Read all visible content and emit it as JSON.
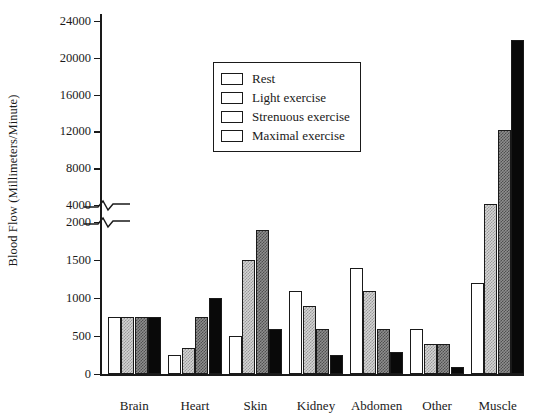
{
  "chart_data": {
    "type": "bar",
    "title": "",
    "xlabel": "",
    "ylabel": "Blood Flow (Millimeters/Minute)",
    "categories": [
      "Brain",
      "Heart",
      "Skin",
      "Kidney",
      "Abdomen",
      "Other",
      "Muscle"
    ],
    "series": [
      {
        "name": "Rest",
        "fill": "white",
        "values": [
          750,
          250,
          500,
          1100,
          1400,
          600,
          1200
        ]
      },
      {
        "name": "Light exercise",
        "fill": "light-hatch",
        "values": [
          750,
          350,
          1500,
          900,
          1100,
          400,
          4200
        ]
      },
      {
        "name": "Strenuous exercise",
        "fill": "dark-hatch",
        "values": [
          750,
          750,
          1900,
          600,
          600,
          400,
          12250
        ]
      },
      {
        "name": "Maximal exercise",
        "fill": "black",
        "values": [
          750,
          1000,
          600,
          250,
          300,
          100,
          22000
        ]
      }
    ],
    "axis_break": {
      "lower_max": 2000,
      "upper_min": 4000
    },
    "lower_ticks": [
      "0",
      "500",
      "1000",
      "1500",
      "2000"
    ],
    "lower_tick_values": [
      0,
      500,
      1000,
      1500,
      2000
    ],
    "upper_ticks": [
      "4000",
      "8000",
      "12000",
      "16000",
      "20000",
      "24000"
    ],
    "upper_tick_values": [
      4000,
      8000,
      12000,
      16000,
      20000,
      24000
    ],
    "ylim": [
      0,
      24000
    ],
    "grid": false,
    "legend_position": "upper-center",
    "legend_entries": [
      "Rest",
      "Light exercise",
      "Strenuous exercise",
      "Maximal exercise"
    ]
  }
}
